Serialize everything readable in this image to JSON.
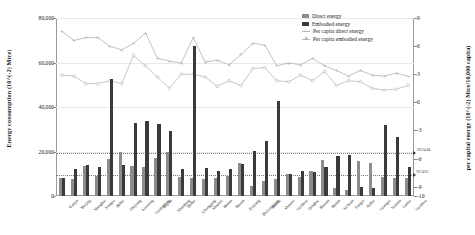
{
  "chart_data": {
    "type": "bar",
    "title": "",
    "xlabel": "",
    "ylabel": "Energy consumption (10^(-2) Mtce)",
    "y2label": "per capital energy (10^(-2) Mtce/10,000 capita)",
    "ylim": [
      0,
      80000
    ],
    "y2lim": [
      -10,
      9
    ],
    "yticks": [
      "0",
      "20,000",
      "40,000",
      "60,000",
      "80,000"
    ],
    "ytick_values": [
      0,
      20000,
      40000,
      60000,
      80000
    ],
    "y2ticks": [
      "-10",
      "-9",
      "-6",
      "-3",
      "0",
      "3",
      "6",
      "9"
    ],
    "y2tick_values": [
      -10,
      -9,
      -6,
      -3,
      0,
      3,
      6,
      9
    ],
    "grid": true,
    "legend_position": "top-right",
    "reference_lines": [
      {
        "label": "19514.84",
        "value": 19514.84
      },
      {
        "label": "9574.93",
        "value": 9574.93
      }
    ],
    "categories": [
      "Tianjin",
      "Beijing",
      "Shanghai",
      "Jiangsu",
      "Hebei",
      "Zhejiang",
      "Liaoning",
      "Guangdong",
      "Fujian",
      "Shandong",
      "Hubei",
      "Chongqing",
      "Shaanxi",
      "Henan",
      "Hunan",
      "Xinjiang",
      "Heilongjiang",
      "Shanxi",
      "Shaanxi2",
      "Guizhou",
      "Qinghai",
      "Hainan",
      "Henan2",
      "Sichuan",
      "Jiangxi",
      "Anhui",
      "Guangxi",
      "Yunnan",
      "Gansu",
      "Guizhou2"
    ],
    "series": [
      {
        "name": "Direct energy",
        "color": "#8c8c8c",
        "values": [
          8200,
          7800,
          13500,
          8900,
          16800,
          19800,
          13600,
          12900,
          17300,
          19700,
          8600,
          8000,
          7600,
          8200,
          8900,
          15000,
          4600,
          6800,
          7500,
          9900,
          8400,
          11200,
          16200,
          3800,
          2700,
          15600,
          14800,
          8600,
          8200,
          8300
        ]
      },
      {
        "name": "Embodied energy",
        "color": "#3a3a3a",
        "values": [
          8300,
          12000,
          13900,
          13000,
          52400,
          13800,
          33000,
          33900,
          32200,
          29000,
          12300,
          67500,
          12400,
          11300,
          12200,
          14600,
          20300,
          24600,
          42700,
          9800,
          11400,
          10800,
          13200,
          17900,
          18300,
          4200,
          3400,
          32000,
          26700,
          13100
        ]
      }
    ],
    "line_series": [
      {
        "name": "Per capita direct energy",
        "marker": "circle",
        "color": "#b0b0b0",
        "values": [
          2.9,
          2.8,
          2.0,
          2.0,
          2.3,
          2.0,
          5.0,
          3.9,
          2.7,
          1.5,
          3.0,
          3.0,
          2.7,
          1.7,
          2.3,
          1.8,
          3.6,
          3.7,
          2.3,
          2.2,
          2.9,
          2.3,
          3.3,
          1.8,
          2.3,
          2.2,
          1.5,
          1.3,
          1.4,
          1.8
        ]
      },
      {
        "name": "Per capita embodied energy",
        "marker": "star",
        "color": "#a8a8a8",
        "values": [
          7.6,
          6.6,
          6.9,
          6.9,
          6.0,
          5.6,
          6.3,
          7.4,
          4.7,
          4.4,
          4.2,
          6.9,
          4.3,
          4.5,
          4.0,
          5.1,
          6.3,
          6.1,
          3.9,
          4.2,
          4.0,
          4.7,
          3.9,
          3.4,
          2.8,
          3.4,
          2.9,
          2.8,
          3.1,
          2.8
        ]
      }
    ]
  },
  "legend": {
    "items": [
      {
        "label": "Direct energy",
        "type": "swatch",
        "color": "#8c8c8c"
      },
      {
        "label": "Embodied energy",
        "type": "swatch",
        "color": "#3a3a3a"
      },
      {
        "label": "Per capita direct energy",
        "type": "line-circle",
        "color": "#b0b0b0"
      },
      {
        "label": "Per capita embodied energy",
        "type": "line-star",
        "color": "#a8a8a8"
      }
    ]
  }
}
